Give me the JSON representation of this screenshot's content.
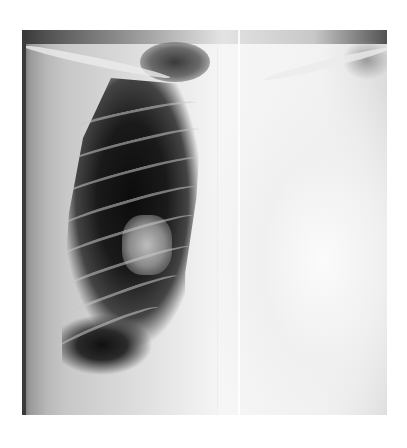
{
  "image": {
    "type": "chest radiograph",
    "view": "frontal",
    "description": "Chest X-ray showing an aerated lung field on the image left side and a homogeneous opacity over the right side, with a thin vertical line through the center",
    "colors": {
      "background": "#ffffff",
      "lung_dark": "#111111",
      "opacity_bright": "#f6f6f6"
    }
  }
}
